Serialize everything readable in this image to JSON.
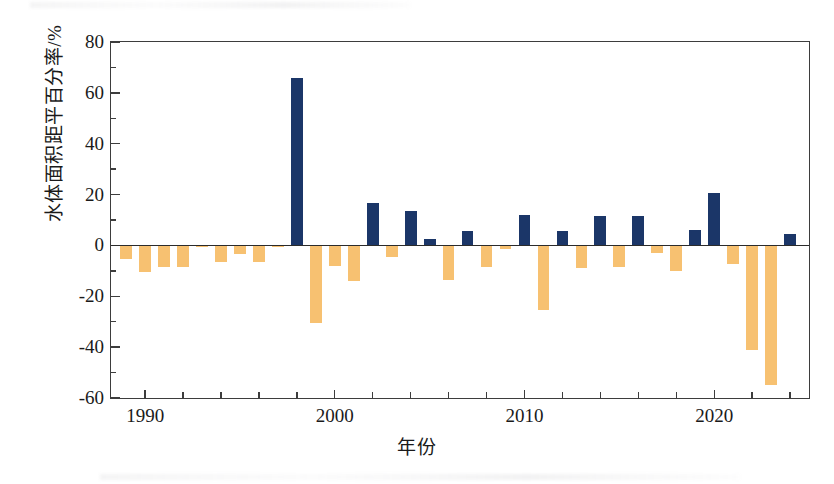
{
  "chart_data": {
    "type": "bar",
    "title": "",
    "xlabel": "年份",
    "ylabel": "水体面积距平百分率/%",
    "xlim": [
      1988.2,
      2025.0
    ],
    "ylim": [
      -60,
      80
    ],
    "grid": false,
    "legend": "none",
    "y_ticks_major": [
      -60,
      -40,
      -20,
      0,
      20,
      40,
      60,
      80
    ],
    "y_ticks_minor": [
      -50,
      -30,
      -10,
      10,
      30,
      50,
      70
    ],
    "y_tick_labels": [
      "-60",
      "-40",
      "-20",
      "0",
      "20",
      "40",
      "60",
      "80"
    ],
    "x_ticks_major": [
      1990,
      2000,
      2010,
      2020
    ],
    "x_tick_labels": [
      "1990",
      "2000",
      "2010",
      "2020"
    ],
    "x_ticks_minor": [
      1990,
      1992,
      1994,
      1996,
      1998,
      2000,
      2002,
      2004,
      2006,
      2008,
      2010,
      2012,
      2014,
      2016,
      2018,
      2020,
      2022,
      2024
    ],
    "colors": {
      "positive": "#1b3668",
      "negative": "#f7c171",
      "axis": "#3d3d3d",
      "text": "#1a1a1a"
    },
    "categories": [
      1989,
      1990,
      1991,
      1992,
      1993,
      1994,
      1995,
      1996,
      1997,
      1998,
      1999,
      2000,
      2001,
      2002,
      2003,
      2004,
      2005,
      2006,
      2007,
      2008,
      2009,
      2010,
      2011,
      2012,
      2013,
      2014,
      2015,
      2016,
      2017,
      2018,
      2019,
      2020,
      2021,
      2022,
      2023,
      2024
    ],
    "values": [
      -5.5,
      -10.5,
      -8.5,
      -8.5,
      -0.5,
      -6.5,
      -3.5,
      -6.5,
      -0.5,
      66.0,
      -30.5,
      -8.0,
      -14.0,
      16.5,
      -4.5,
      13.5,
      2.5,
      -13.5,
      5.5,
      -8.5,
      -1.5,
      12.0,
      -25.5,
      5.5,
      -9.0,
      11.5,
      -8.5,
      11.5,
      -3.0,
      -10.0,
      6.0,
      20.5,
      -7.5,
      -41.0,
      -55.0,
      4.5
    ]
  }
}
